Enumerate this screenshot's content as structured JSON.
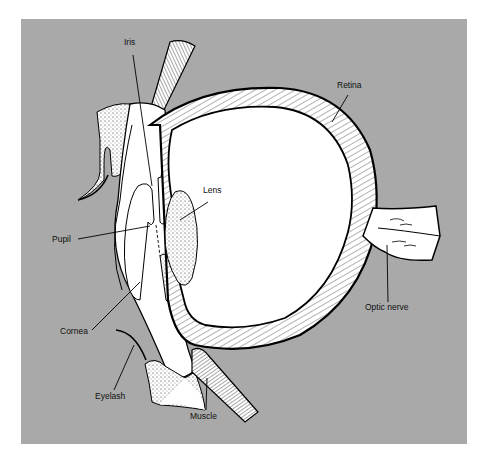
{
  "diagram": {
    "background_color": "#a9a9a9",
    "labels": [
      {
        "id": "iris",
        "text": "Iris"
      },
      {
        "id": "retina",
        "text": "Retina"
      },
      {
        "id": "lens",
        "text": "Lens"
      },
      {
        "id": "pupil",
        "text": "Pupil"
      },
      {
        "id": "optic_nerve",
        "text": "Optic nerve"
      },
      {
        "id": "cornea",
        "text": "Cornea"
      },
      {
        "id": "eyelash",
        "text": "Eyelash"
      },
      {
        "id": "muscle",
        "text": "Muscle"
      }
    ]
  }
}
